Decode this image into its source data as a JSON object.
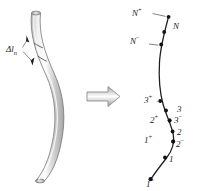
{
  "figure": {
    "caption_text": "",
    "background_color": "#ffffff",
    "ink_color": "#1c1c1c",
    "left_panel": {
      "name": "continuous-curved-rod",
      "description_label": "",
      "segment_label": {
        "base": "Δl",
        "subscript": "n",
        "x": 10,
        "y": 48
      },
      "tube_fill_light": "#f2f2f2",
      "tube_fill_mid": "#c9c9c9",
      "tube_outline": "#8a8a8a",
      "centerline_path": "M 36 12 C 34 34, 40 52, 50 74 C 60 96, 62 120, 56 146 C 52 164, 46 174, 40 181",
      "tube_half_width": 4.2,
      "tick_marks": [
        {
          "name": "upper-segment-tick",
          "x1": 27,
          "y1": 38,
          "x2": 41,
          "y2": 52
        },
        {
          "name": "lower-segment-tick",
          "x1": 30,
          "y1": 56,
          "x2": 45,
          "y2": 66
        }
      ],
      "leader_lines": [
        {
          "name": "upper-leader",
          "x1": 20,
          "y1": 50,
          "x2": 30,
          "y2": 41
        },
        {
          "name": "lower-leader",
          "x1": 20,
          "y1": 53,
          "x2": 32,
          "y2": 60
        }
      ]
    },
    "arrow": {
      "name": "implication-arrow",
      "glyph": "⇒",
      "x": 86,
      "y": 88,
      "width": 34,
      "height": 18,
      "outline_color": "#8d8d8d",
      "fill_color": "#ffffff"
    },
    "right_panel": {
      "name": "discretized-curve",
      "curve_path": "M 168 17 C 166 38, 160 56, 160 80 C 160 104, 168 118, 172 130 C 176 142, 172 152, 164 162 C 158 170, 154 175, 150 179",
      "curve_color": "#1c1c1c",
      "curve_width": 1.2,
      "nodes": [
        {
          "id": "N-plus",
          "label": "N",
          "superscript": "+",
          "px": 168,
          "py": 17,
          "lx": 140,
          "ly": 10,
          "dot": true
        },
        {
          "id": "N",
          "label": "N",
          "superscript": "",
          "px": 165,
          "py": 30,
          "lx": 174,
          "ly": 24,
          "dot": true
        },
        {
          "id": "N-minus",
          "label": "N",
          "superscript": "−",
          "px": 162,
          "py": 44,
          "lx": 136,
          "ly": 38,
          "dot": true
        },
        {
          "id": "3-plus",
          "label": "3",
          "superscript": "+",
          "px": 161,
          "py": 101,
          "lx": 147,
          "ly": 96,
          "dot": true
        },
        {
          "id": "3",
          "label": "3",
          "superscript": "",
          "px": 169,
          "py": 112,
          "lx": 179,
          "ly": 107,
          "dot": true
        },
        {
          "id": "3-minus",
          "label": "3",
          "superscript": "−",
          "px": 171,
          "py": 122,
          "lx": 178,
          "ly": 118,
          "dot": true
        },
        {
          "id": "2-plus",
          "label": "2",
          "superscript": "+",
          "px": 170,
          "py": 122,
          "lx": 152,
          "ly": 118,
          "dot": true
        },
        {
          "id": "2",
          "label": "2",
          "superscript": "",
          "px": 173,
          "py": 133,
          "lx": 178,
          "ly": 130,
          "dot": true
        },
        {
          "id": "2-minus",
          "label": "2",
          "superscript": "−",
          "px": 172,
          "py": 144,
          "lx": 177,
          "ly": 142,
          "dot": true
        },
        {
          "id": "1-plus",
          "label": "1",
          "superscript": "+",
          "px": 170,
          "py": 141,
          "lx": 146,
          "ly": 137,
          "dot": true
        },
        {
          "id": "1",
          "label": "1",
          "superscript": "",
          "px": 165,
          "py": 158,
          "lx": 170,
          "ly": 157,
          "dot": true
        },
        {
          "id": "1-minus",
          "label": "1",
          "superscript": "−",
          "px": 150,
          "py": 179,
          "lx": 148,
          "ly": 180,
          "dot": true
        }
      ]
    }
  }
}
